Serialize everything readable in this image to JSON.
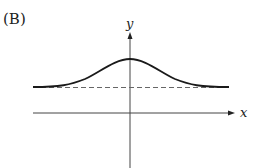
{
  "panel_label": "(B)",
  "axes": {
    "x_label": "x",
    "y_label": "y"
  },
  "curve": {
    "type": "bell-shaped",
    "asymptote": "horizontal dashed line above x-axis",
    "peak_at": "x = 0"
  },
  "colors": {
    "curve": "#1a1a1a",
    "axis": "#333333",
    "dashed": "#666666"
  }
}
